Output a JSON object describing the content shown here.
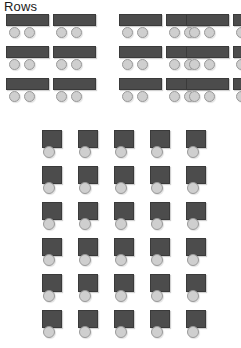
{
  "page": {
    "title": "Rows",
    "background_color": "#ffffff"
  },
  "palette": {
    "seat_back": "#4c4c4c",
    "seat_back_border": "#3a3a3a",
    "seat_cushion": "#cfcfcf",
    "seat_cushion_border": "#9a9a9a",
    "label_text": "#1a1a1a"
  },
  "top_section": {
    "name": "bench-grid",
    "icon_name": "bench-seat-icon",
    "rows": 3,
    "columns": 6,
    "column_pairs": 3,
    "seats_per_icon": 2,
    "total_icons": 18,
    "row_tops": [
      0,
      32,
      64
    ],
    "column_lefts": [
      6,
      53,
      119,
      166,
      186,
      233
    ],
    "icon_label": "Bench row seat"
  },
  "bottom_section": {
    "name": "chair-grid",
    "icon_name": "chair-seat-icon",
    "rows": 6,
    "columns": 5,
    "seats_per_icon": 1,
    "total_icons": 30,
    "row_tops": [
      0,
      36,
      72,
      108,
      144,
      180
    ],
    "column_lefts": [
      38,
      74,
      110,
      146,
      182
    ],
    "icon_label": "Single chair seat"
  }
}
